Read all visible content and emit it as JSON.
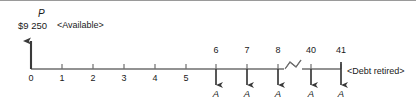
{
  "diagram": {
    "type": "cash-flow-diagram",
    "present_value": {
      "symbol": "P",
      "amount": "$9 250",
      "tag": "<Available>",
      "direction": "up",
      "period": 0
    },
    "axis": {
      "label_0": "0",
      "label_1": "1",
      "label_2": "2",
      "label_3": "3",
      "label_4": "4",
      "label_5": "5",
      "label_6": "6",
      "label_7": "7",
      "label_8": "8",
      "label_40": "40",
      "label_41": "41",
      "break_between": "8 and 40"
    },
    "outflows": [
      {
        "period": "6",
        "label": "A"
      },
      {
        "period": "7",
        "label": "A"
      },
      {
        "period": "8",
        "label": "A"
      },
      {
        "period": "40",
        "label": "A"
      },
      {
        "period": "41",
        "label": "A"
      }
    ],
    "end_tag": "<Debt retired>",
    "colors": {
      "line": "#4d4d4d",
      "text": "#1a1a1a",
      "background": "#ffffff",
      "frame": "#9a9a9a"
    }
  }
}
